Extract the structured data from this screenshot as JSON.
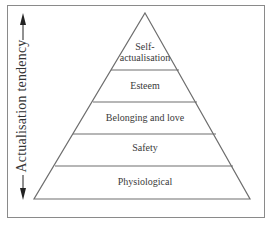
{
  "diagram": {
    "type": "pyramid",
    "axis": {
      "label": "Actualisation tendency",
      "arrows": [
        "arrow-up",
        "arrow-down"
      ]
    },
    "levels": [
      {
        "label_line1": "Self-",
        "label_line2": "actualisation"
      },
      {
        "label": "Esteem"
      },
      {
        "label": "Belonging and love"
      },
      {
        "label": "Safety"
      },
      {
        "label": "Physiological"
      }
    ],
    "colors": {
      "stroke": "#6e6e6e",
      "text": "#333333",
      "background": "#ffffff"
    }
  }
}
